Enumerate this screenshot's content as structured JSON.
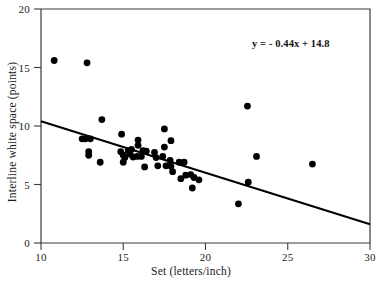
{
  "chart_data": {
    "type": "scatter",
    "title": "",
    "xlabel": "Set (letters/inch)",
    "ylabel": "Interline white space (points)",
    "xlim": [
      10,
      30
    ],
    "ylim": [
      0,
      20
    ],
    "xticks": [
      10,
      15,
      20,
      25,
      30
    ],
    "yticks": [
      0,
      5,
      10,
      15,
      20
    ],
    "grid": false,
    "legend": null,
    "annotations": [
      {
        "text": "y = - 0.44x + 14.8",
        "x": 23.5,
        "y": 17.3
      }
    ],
    "fit_line": {
      "label": "y = - 0.44x + 14.8",
      "slope": -0.44,
      "intercept": 14.8,
      "x_start": 10,
      "y_start": 10.4,
      "x_end": 30,
      "y_end": 1.6,
      "color": "#000000"
    },
    "marker": {
      "shape": "circle",
      "color": "#000000",
      "size": 3.4
    },
    "points": [
      {
        "x": 10.8,
        "y": 15.6
      },
      {
        "x": 12.8,
        "y": 15.4
      },
      {
        "x": 12.5,
        "y": 8.9
      },
      {
        "x": 12.7,
        "y": 8.9
      },
      {
        "x": 13.0,
        "y": 8.9
      },
      {
        "x": 12.9,
        "y": 7.8
      },
      {
        "x": 12.9,
        "y": 7.5
      },
      {
        "x": 13.7,
        "y": 10.55
      },
      {
        "x": 13.6,
        "y": 6.9
      },
      {
        "x": 14.9,
        "y": 9.3
      },
      {
        "x": 14.85,
        "y": 7.8
      },
      {
        "x": 15.0,
        "y": 7.5
      },
      {
        "x": 15.1,
        "y": 7.3
      },
      {
        "x": 15.0,
        "y": 6.9
      },
      {
        "x": 15.3,
        "y": 7.9
      },
      {
        "x": 15.4,
        "y": 7.6
      },
      {
        "x": 15.5,
        "y": 8.0
      },
      {
        "x": 15.6,
        "y": 7.35
      },
      {
        "x": 15.9,
        "y": 8.8
      },
      {
        "x": 15.9,
        "y": 8.35
      },
      {
        "x": 15.85,
        "y": 7.4
      },
      {
        "x": 16.1,
        "y": 7.4
      },
      {
        "x": 16.2,
        "y": 7.9
      },
      {
        "x": 16.4,
        "y": 7.85
      },
      {
        "x": 16.3,
        "y": 6.5
      },
      {
        "x": 16.9,
        "y": 7.75
      },
      {
        "x": 17.0,
        "y": 7.3
      },
      {
        "x": 17.1,
        "y": 6.6
      },
      {
        "x": 17.4,
        "y": 7.4
      },
      {
        "x": 17.5,
        "y": 9.75
      },
      {
        "x": 17.5,
        "y": 8.2
      },
      {
        "x": 17.6,
        "y": 6.6
      },
      {
        "x": 17.9,
        "y": 8.75
      },
      {
        "x": 17.85,
        "y": 7.05
      },
      {
        "x": 17.9,
        "y": 6.55
      },
      {
        "x": 18.0,
        "y": 6.1
      },
      {
        "x": 18.4,
        "y": 6.9
      },
      {
        "x": 18.5,
        "y": 5.5
      },
      {
        "x": 18.7,
        "y": 6.9
      },
      {
        "x": 18.8,
        "y": 5.8
      },
      {
        "x": 19.1,
        "y": 5.85
      },
      {
        "x": 19.3,
        "y": 5.6
      },
      {
        "x": 19.2,
        "y": 4.7
      },
      {
        "x": 19.6,
        "y": 5.4
      },
      {
        "x": 22.0,
        "y": 3.35
      },
      {
        "x": 22.55,
        "y": 11.7
      },
      {
        "x": 22.6,
        "y": 5.2
      },
      {
        "x": 23.1,
        "y": 7.4
      },
      {
        "x": 26.5,
        "y": 6.75
      }
    ]
  },
  "axes": {
    "x_tick_labels": [
      "10",
      "15",
      "20",
      "25",
      "30"
    ],
    "y_tick_labels": [
      "0",
      "5",
      "10",
      "15",
      "20"
    ]
  }
}
